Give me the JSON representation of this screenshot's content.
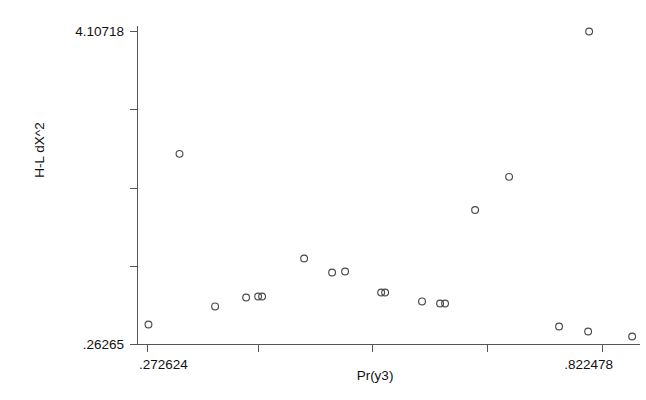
{
  "chart_data": {
    "type": "scatter",
    "title": "",
    "xlabel": "Pr(y3)",
    "ylabel": "H-L dX^2",
    "xlim": [
      0.272624,
      0.822478
    ],
    "ylim": [
      0.26265,
      4.10718
    ],
    "xtick_labels": [
      ".272624",
      ".822478"
    ],
    "ytick_labels": [
      "4.10718",
      ".26265"
    ],
    "xticks": [
      0.272624,
      0.410088,
      0.551266,
      0.693686,
      0.822478
    ],
    "yticks": [
      0.26265,
      1.18355,
      2.15983,
      3.13611,
      4.10718
    ],
    "grid": false,
    "legend": null,
    "marker": "open-circle",
    "points": [
      {
        "x": 0.2738,
        "y": 0.5088
      },
      {
        "x": 0.3113,
        "y": 2.6044
      },
      {
        "x": 0.3543,
        "y": 0.7301
      },
      {
        "x": 0.3918,
        "y": 0.8406
      },
      {
        "x": 0.4063,
        "y": 0.8529
      },
      {
        "x": 0.4111,
        "y": 0.8529
      },
      {
        "x": 0.4619,
        "y": 1.3184
      },
      {
        "x": 0.4957,
        "y": 1.1464
      },
      {
        "x": 0.5114,
        "y": 1.1587
      },
      {
        "x": 0.555,
        "y": 0.9009
      },
      {
        "x": 0.5598,
        "y": 0.9009
      },
      {
        "x": 0.6044,
        "y": 0.7915
      },
      {
        "x": 0.6262,
        "y": 0.7669
      },
      {
        "x": 0.6322,
        "y": 0.7669
      },
      {
        "x": 0.6685,
        "y": 1.9146
      },
      {
        "x": 0.7096,
        "y": 2.3216
      },
      {
        "x": 0.8063,
        "y": 4.1072
      },
      {
        "x": 0.77,
        "y": 0.4843
      },
      {
        "x": 0.8051,
        "y": 0.4229
      },
      {
        "x": 0.8583,
        "y": 0.3615
      }
    ]
  },
  "axes": {
    "y_max_label": "4.10718",
    "y_min_label": ".26265",
    "x_min_label": ".272624",
    "x_max_label": ".822478",
    "x_title": "Pr(y3)",
    "y_title": "H-L dX^2"
  },
  "colors": {
    "background": "#ffffff",
    "axis": "#555555",
    "marker_stroke": "#4a4a4a",
    "text": "#111111"
  }
}
